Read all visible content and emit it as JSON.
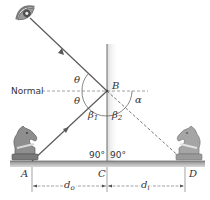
{
  "diagram": {
    "colors": {
      "ray": "#5a5a5a",
      "mirror": "#6b6b6b",
      "mirror_shade": "#e4e4e4",
      "floor": "#9a9a9a",
      "floor_dark": "#707070",
      "dashed": "#777777",
      "text": "#333333",
      "knight": "#8c8c8c"
    },
    "labels": {
      "normal": "Normal",
      "point_A": "A",
      "point_B": "B",
      "point_C": "C",
      "point_D": "D",
      "theta_upper": "θ",
      "theta_lower": "θ",
      "beta1_sym": "β",
      "beta1_sub": "1",
      "beta2_sym": "β",
      "beta2_sub": "2",
      "alpha": "α",
      "angle_left_90": "90°",
      "angle_right_90": "90°",
      "d_o_sym": "d",
      "d_o_sub": "o",
      "d_i_sym": "d",
      "d_i_sub": "i"
    },
    "objects": {
      "observer": "eye-icon",
      "object": "knight-chess-piece",
      "image": "knight-chess-piece-mirrored",
      "mirror": "vertical-plane-mirror"
    }
  }
}
